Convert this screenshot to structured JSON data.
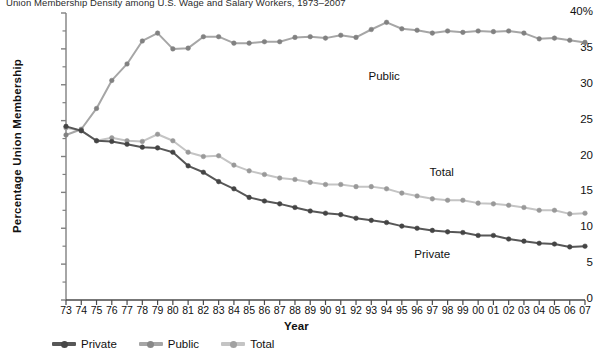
{
  "chart_data": {
    "type": "line",
    "title": "Union Membership Density among U.S. Wage and Salary Workers, 1973–2007",
    "xlabel": "Year",
    "ylabel": "Percentage Union Membership",
    "x": [
      1973,
      1974,
      1975,
      1976,
      1977,
      1978,
      1979,
      1980,
      1981,
      1982,
      1983,
      1984,
      1985,
      1986,
      1987,
      1988,
      1989,
      1990,
      1991,
      1992,
      1993,
      1994,
      1995,
      1996,
      1997,
      1998,
      1999,
      2000,
      2001,
      2002,
      2003,
      2004,
      2005,
      2006,
      2007
    ],
    "categories": [
      "73",
      "74",
      "75",
      "76",
      "77",
      "78",
      "79",
      "80",
      "81",
      "82",
      "83",
      "84",
      "85",
      "86",
      "87",
      "88",
      "89",
      "90",
      "91",
      "92",
      "93",
      "94",
      "95",
      "96",
      "97",
      "98",
      "99",
      "00",
      "01",
      "02",
      "03",
      "04",
      "05",
      "06",
      "07"
    ],
    "xlim": [
      1973,
      2007
    ],
    "ylim": [
      0,
      40
    ],
    "yticks": [
      0,
      5,
      10,
      15,
      20,
      25,
      30,
      35,
      40
    ],
    "ytick_labels": [
      "0",
      "5",
      "10",
      "15",
      "20",
      "25",
      "30",
      "35",
      "40%"
    ],
    "yminor_step": 2.5,
    "grid": false,
    "legend_position": "bottom-left",
    "series": [
      {
        "name": "Private",
        "color": "#575757",
        "marker": "circle",
        "annotation": "Private",
        "values": [
          24.2,
          23.6,
          22.2,
          22.1,
          21.7,
          21.3,
          21.2,
          20.6,
          18.7,
          17.8,
          16.5,
          15.5,
          14.3,
          13.8,
          13.4,
          12.9,
          12.4,
          12.1,
          11.9,
          11.4,
          11.1,
          10.8,
          10.3,
          10.0,
          9.7,
          9.5,
          9.4,
          9.0,
          9.0,
          8.5,
          8.2,
          7.9,
          7.8,
          7.4,
          7.5
        ]
      },
      {
        "name": "Public",
        "color": "#a6a6a6",
        "marker": "circle",
        "annotation": "Public",
        "values": [
          23.0,
          23.8,
          26.7,
          30.6,
          32.9,
          36.1,
          37.2,
          35.0,
          35.1,
          36.7,
          36.7,
          35.8,
          35.8,
          36.0,
          36.0,
          36.6,
          36.7,
          36.5,
          36.9,
          36.6,
          37.7,
          38.7,
          37.8,
          37.6,
          37.2,
          37.5,
          37.3,
          37.5,
          37.4,
          37.5,
          37.2,
          36.4,
          36.5,
          36.2,
          35.9
        ]
      },
      {
        "name": "Total",
        "color": "#c4c4c4",
        "marker": "circle",
        "annotation": "Total",
        "values": [
          24.0,
          23.6,
          22.2,
          22.6,
          22.2,
          22.1,
          23.1,
          22.2,
          20.6,
          20.0,
          20.1,
          18.8,
          18.0,
          17.5,
          17.0,
          16.8,
          16.4,
          16.1,
          16.1,
          15.8,
          15.8,
          15.5,
          14.9,
          14.5,
          14.1,
          13.9,
          13.9,
          13.5,
          13.4,
          13.2,
          12.9,
          12.5,
          12.5,
          12.0,
          12.1
        ]
      }
    ],
    "annotations": [
      {
        "label": "Public",
        "x": 1994,
        "y": 31.0
      },
      {
        "label": "Total",
        "x": 1998,
        "y": 17.5
      },
      {
        "label": "Private",
        "x": 1997,
        "y": 6.2
      }
    ]
  },
  "legend": {
    "items": [
      {
        "label": "Private",
        "color": "#575757"
      },
      {
        "label": "Public",
        "color": "#a6a6a6"
      },
      {
        "label": "Total",
        "color": "#c4c4c4"
      }
    ]
  },
  "axis": {
    "y_suffix": "%",
    "axis_color": "#808080"
  }
}
